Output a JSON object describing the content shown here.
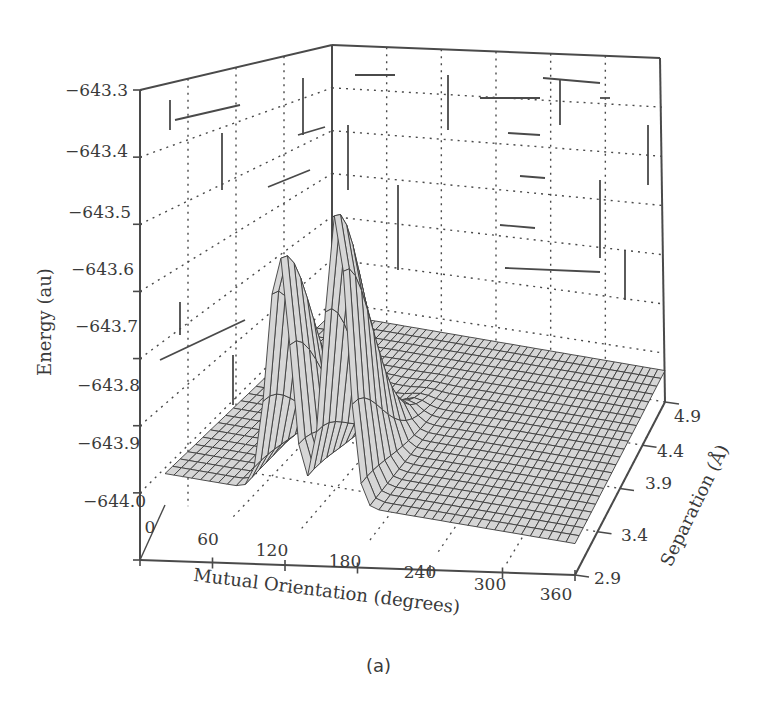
{
  "caption": "(a)",
  "chart_data": {
    "type": "surface3d",
    "title": "",
    "xlabel": "Mutual Orientation (degrees)",
    "ylabel": "Separation (Å)",
    "zlabel": "Energy (au)",
    "x_ticks": [
      "0",
      "60",
      "120",
      "180",
      "240",
      "300",
      "360"
    ],
    "y_ticks": [
      "2.9",
      "3.4",
      "3.9",
      "4.4",
      "4.9"
    ],
    "z_ticks": [
      "−643.3",
      "−643.4",
      "−643.5",
      "−643.6",
      "−643.7",
      "−643.8",
      "−643.9",
      "−644.0"
    ],
    "xlim": [
      0,
      360
    ],
    "ylim": [
      2.9,
      4.9
    ],
    "zlim": [
      -644.0,
      -643.3
    ],
    "grid": true,
    "legend": null,
    "baseline_energy": -643.95,
    "peaks": [
      {
        "orientation_deg": 100,
        "separation_A": 2.9,
        "energy_au": -643.57
      },
      {
        "orientation_deg": 150,
        "separation_A": 2.9,
        "energy_au": -643.49
      }
    ],
    "valley_between_peaks": {
      "orientation_deg": 125,
      "separation_A": 2.9,
      "energy_au": -643.93
    }
  },
  "axes": {
    "z_label": "Energy (au)",
    "x_label": "Mutual Orientation (degrees)",
    "y_label": "Separation (Å)"
  }
}
